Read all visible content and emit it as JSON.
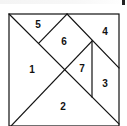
{
  "diagram": {
    "type": "tangram",
    "stroke_color": "#111111",
    "background": "#ffffff",
    "pieces": [
      {
        "id": "1",
        "label": "1",
        "x": 32,
        "y": 70
      },
      {
        "id": "2",
        "label": "2",
        "x": 63,
        "y": 107
      },
      {
        "id": "3",
        "label": "3",
        "x": 105,
        "y": 84
      },
      {
        "id": "4",
        "label": "4",
        "x": 105,
        "y": 32
      },
      {
        "id": "5",
        "label": "5",
        "x": 38,
        "y": 25
      },
      {
        "id": "6",
        "label": "6",
        "x": 64,
        "y": 42
      },
      {
        "id": "7",
        "label": "7",
        "x": 82,
        "y": 69
      }
    ]
  }
}
